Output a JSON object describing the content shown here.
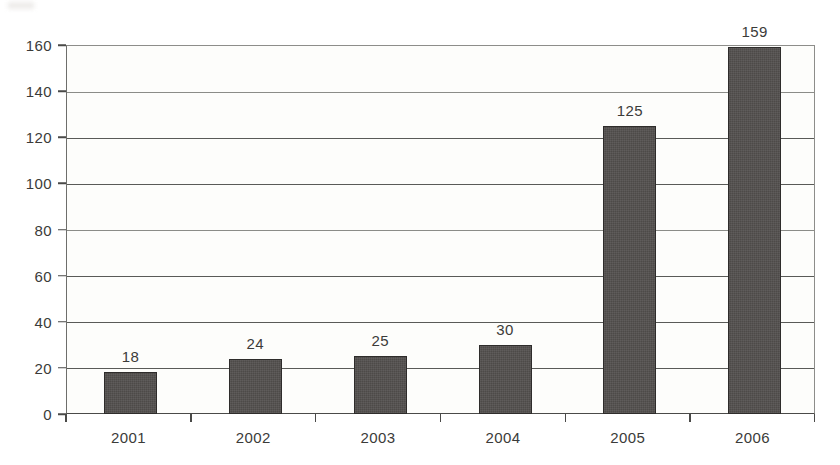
{
  "chart_data": {
    "type": "bar",
    "title": "",
    "subtitle": "",
    "xlabel": "",
    "ylabel": "",
    "categories": [
      "2001",
      "2002",
      "2003",
      "2004",
      "2005",
      "2006"
    ],
    "values": [
      18,
      24,
      25,
      30,
      125,
      159
    ],
    "data_labels": [
      "18",
      "24",
      "25",
      "30",
      "125",
      "159"
    ],
    "ylim": [
      0,
      160
    ],
    "y_ticks": [
      0,
      20,
      40,
      60,
      80,
      100,
      120,
      140,
      160
    ],
    "y_tick_labels": [
      "0",
      "20",
      "40",
      "60",
      "80",
      "100",
      "120",
      "140",
      "160"
    ],
    "grid": "horizontal",
    "legend": "none",
    "series": [
      {
        "name": "",
        "values": [
          18,
          24,
          25,
          30,
          125,
          159
        ],
        "color": "#4d4a48"
      }
    ]
  },
  "style": {
    "bar_color": "#4d4a48",
    "bar_border_color": "#2e2c2b",
    "gridline_color": "#595a57",
    "axis_color": "#4a4a48",
    "text_color": "#3b3b39",
    "plot_background": "#fdfdfb",
    "page_background": "#ffffff"
  }
}
